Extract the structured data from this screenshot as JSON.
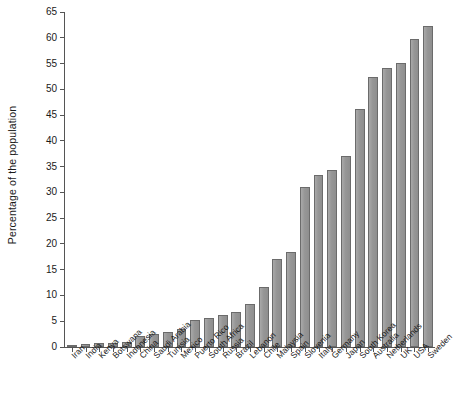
{
  "chart_data": {
    "type": "bar",
    "title": "",
    "subtitle": "",
    "xlabel": "",
    "ylabel": "Percentage of the population",
    "ylim": [
      0,
      65
    ],
    "ytick_step": 5,
    "yticks": [
      0,
      5,
      10,
      15,
      20,
      25,
      30,
      35,
      40,
      45,
      50,
      55,
      60,
      65
    ],
    "ytick_labels": [
      "0",
      "5",
      "10",
      "15",
      "20",
      "25",
      "30",
      "35",
      "40",
      "45",
      "50",
      "55",
      "60",
      "65"
    ],
    "grid": false,
    "legend": null,
    "legend_position": "none",
    "bar_color": "#969696",
    "bar_edge_color": "#6b6b6b",
    "axis_color": "#555555",
    "background_color": "#ffffff",
    "xlabel_rotation": -45,
    "categories": [
      "Iran",
      "India",
      "Kenya",
      "Botswana",
      "Indonesia",
      "China",
      "Saudi Arabia",
      "Tunisia",
      "Mexico",
      "Puerto Rico",
      "South Africa",
      "Russia",
      "Brazil",
      "Lebanon",
      "Chile",
      "Malaysia",
      "Spain",
      "Slovenia",
      "Italy",
      "Germany",
      "Japan",
      "South Korea",
      "Australia",
      "Netherlands",
      "UK",
      "USA",
      "Sweden"
    ],
    "values": [
      0.4,
      0.5,
      0.7,
      0.8,
      0.9,
      2.1,
      2.5,
      2.9,
      3.4,
      5.2,
      5.6,
      6.3,
      6.8,
      8.4,
      11.6,
      17.0,
      18.5,
      31.1,
      33.3,
      34.4,
      37.1,
      46.2,
      52.3,
      54.1,
      55.2,
      59.7,
      62.3
    ]
  }
}
